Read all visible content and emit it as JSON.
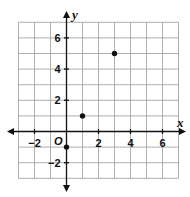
{
  "chart_data": {
    "type": "scatter",
    "title": "",
    "xlabel": "x",
    "ylabel": "y",
    "origin_label": "O",
    "xlim": [
      -3,
      7
    ],
    "ylim": [
      -3,
      7
    ],
    "grid": true,
    "x_ticks": [
      -2,
      2,
      4,
      6
    ],
    "x_tick_labels": [
      "−2",
      "2",
      "4",
      "6"
    ],
    "y_ticks": [
      -2,
      2,
      4,
      6
    ],
    "y_tick_labels": [
      "−2",
      "2",
      "4",
      "6"
    ],
    "points": [
      {
        "x": 0,
        "y": -1
      },
      {
        "x": 1,
        "y": 1
      },
      {
        "x": 3,
        "y": 5
      }
    ],
    "colors": {
      "grid": "#9a9a9a",
      "axis": "#111111",
      "point": "#111111"
    }
  }
}
